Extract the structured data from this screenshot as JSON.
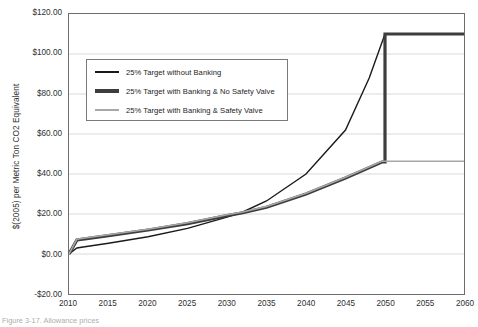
{
  "figure": {
    "caption": "Figure 3-17. Allowance prices"
  },
  "chart_data": {
    "type": "line",
    "title": "",
    "xlabel": "",
    "ylabel": "$(2005) per Metric Ton CO2 Equivalent",
    "xlim": [
      2010,
      2060
    ],
    "ylim": [
      -20,
      120
    ],
    "ytick_labels": [
      "$120.00",
      "$100.00",
      "$80.00",
      "$60.00",
      "$40.00",
      "$20.00",
      "$0.00",
      "-$20.00"
    ],
    "ytick_values": [
      120,
      100,
      80,
      60,
      40,
      20,
      0,
      -20
    ],
    "xtick_labels": [
      "2010",
      "2015",
      "2020",
      "2025",
      "2030",
      "2035",
      "2040",
      "2045",
      "2050",
      "2055",
      "2060"
    ],
    "xtick_values": [
      2010,
      2015,
      2020,
      2025,
      2030,
      2035,
      2040,
      2045,
      2050,
      2055,
      2060
    ],
    "grid": "horizontal",
    "legend_position": "upper-left-inside",
    "series": [
      {
        "name": "25% Target without Banking",
        "color": "#1a1a1a",
        "width": 1.4,
        "x": [
          2010,
          2011,
          2012,
          2015,
          2020,
          2025,
          2030,
          2032,
          2035,
          2040,
          2045,
          2048,
          2050,
          2050.4,
          2055,
          2060
        ],
        "y": [
          0.0,
          3.0,
          3.6,
          5.4,
          8.6,
          12.8,
          18.4,
          21.0,
          26.5,
          40.0,
          62.0,
          88.0,
          110.0,
          110.0,
          110.0,
          110.0
        ]
      },
      {
        "name": "25% Target with Banking & No Safety Valve",
        "color": "#3d3d3d",
        "width": 3.2,
        "x": [
          2010,
          2011,
          2012,
          2015,
          2020,
          2025,
          2030,
          2032,
          2035,
          2040,
          2045,
          2049.6,
          2050,
          2050,
          2055,
          2060
        ],
        "y": [
          0.0,
          7.0,
          7.6,
          9.2,
          12.0,
          15.2,
          19.2,
          20.6,
          23.4,
          30.0,
          38.0,
          46.0,
          46.0,
          110.0,
          110.0,
          110.0
        ]
      },
      {
        "name": "25% Target with Banking & Safety Valve",
        "color": "#a8a8a8",
        "width": 1.6,
        "x": [
          2010,
          2011,
          2012,
          2015,
          2020,
          2025,
          2030,
          2032,
          2035,
          2040,
          2045,
          2049.6,
          2050,
          2055,
          2060
        ],
        "y": [
          0.0,
          7.4,
          8.0,
          9.6,
          12.4,
          15.6,
          19.6,
          21.0,
          23.8,
          30.4,
          38.4,
          46.4,
          46.4,
          46.4,
          46.4
        ]
      }
    ]
  },
  "legend": {
    "items": [
      {
        "label": "25% Target without Banking"
      },
      {
        "label": "25% Target with Banking & No Safety Valve"
      },
      {
        "label": "25% Target with Banking & Safety Valve"
      }
    ]
  }
}
